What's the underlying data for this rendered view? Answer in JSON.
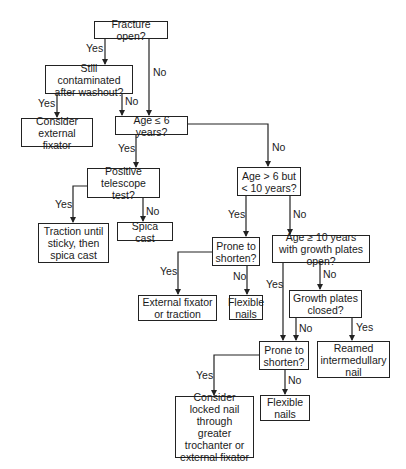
{
  "nodes": {
    "fracture_open": "Fracture open?",
    "still_contaminated": "Still contaminated after washout?",
    "consider_ext_fixator": "Consider external fixator",
    "age_le_6": "Age ≤ 6 years?",
    "positive_telescope": "Positive telescope test?",
    "traction_until_sticky": "Traction until sticky, then spica cast",
    "spica_cast": "Spica cast",
    "age_6_10": "Age > 6 but < 10 years?",
    "prone_shorten_1": "Prone to shorten?",
    "ext_fixator_traction": "External fixator or traction",
    "flexible_nails_1": "Flexible nails",
    "age_ge_10": "Age ≥ 10 years with growth plates open?",
    "growth_plates_closed": "Growth plates closed?",
    "reamed_nail": "Reamed intermedullary nail",
    "prone_shorten_2": "Prone to shorten?",
    "locked_nail": "Consider locked nail through greater trochanter or external fixator",
    "flexible_nails_2": "Flexible nails"
  },
  "edge_labels": {
    "yes": "Yes",
    "no": "No"
  },
  "edges": [
    {
      "from": "fracture_open",
      "to": "still_contaminated",
      "label": "Yes"
    },
    {
      "from": "fracture_open",
      "to": "age_le_6",
      "label": "No"
    },
    {
      "from": "still_contaminated",
      "to": "consider_ext_fixator",
      "label": "Yes"
    },
    {
      "from": "still_contaminated",
      "to": "age_le_6",
      "label": "No"
    },
    {
      "from": "age_le_6",
      "to": "positive_telescope",
      "label": "Yes"
    },
    {
      "from": "age_le_6",
      "to": "age_6_10",
      "label": "No"
    },
    {
      "from": "positive_telescope",
      "to": "traction_until_sticky",
      "label": "Yes"
    },
    {
      "from": "positive_telescope",
      "to": "spica_cast",
      "label": "No"
    },
    {
      "from": "age_6_10",
      "to": "prone_shorten_1",
      "label": "Yes"
    },
    {
      "from": "age_6_10",
      "to": "age_ge_10",
      "label": "No"
    },
    {
      "from": "prone_shorten_1",
      "to": "ext_fixator_traction",
      "label": "Yes"
    },
    {
      "from": "prone_shorten_1",
      "to": "flexible_nails_1",
      "label": "No"
    },
    {
      "from": "age_ge_10",
      "to": "prone_shorten_2",
      "label": "Yes"
    },
    {
      "from": "age_ge_10",
      "to": "growth_plates_closed",
      "label": "No"
    },
    {
      "from": "growth_plates_closed",
      "to": "prone_shorten_2",
      "label": "No"
    },
    {
      "from": "growth_plates_closed",
      "to": "reamed_nail",
      "label": "Yes"
    },
    {
      "from": "prone_shorten_2",
      "to": "locked_nail",
      "label": "Yes"
    },
    {
      "from": "prone_shorten_2",
      "to": "flexible_nails_2",
      "label": "No"
    }
  ]
}
